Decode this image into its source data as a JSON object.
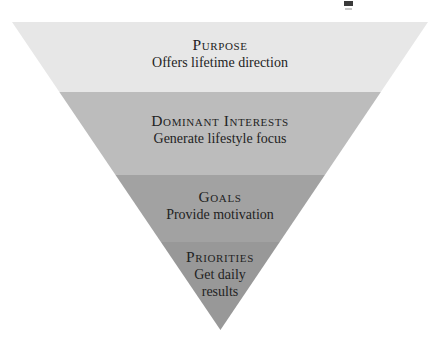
{
  "diagram": {
    "type": "inverted-funnel",
    "orientation": "top-wide-to-bottom-point",
    "background_color": "#ffffff",
    "levels": [
      {
        "id": "purpose",
        "order": 1,
        "title": "Purpose",
        "description": "Offers lifetime direction",
        "fill_color": "#e7e7e7",
        "width_percent": 100
      },
      {
        "id": "dominant-interests",
        "order": 2,
        "title": "Dominant Interests",
        "description": "Generate lifestyle focus",
        "fill_color": "#bcbcbc",
        "width_percent": 77
      },
      {
        "id": "goals",
        "order": 3,
        "title": "Goals",
        "description": "Provide motivation",
        "fill_color": "#a2a2a2",
        "width_percent": 50
      },
      {
        "id": "priorities",
        "order": 4,
        "title": "Priorities",
        "description": "Get daily",
        "description_line2": "results",
        "fill_color": "#989898",
        "width_percent": 28
      }
    ]
  }
}
